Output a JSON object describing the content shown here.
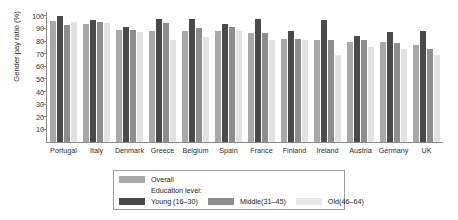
{
  "chart_data": {
    "type": "bar",
    "title": "",
    "xlabel": "",
    "ylabel": "Gender pay ratio (%)",
    "ylim": [
      0,
      103
    ],
    "yticks": [
      10,
      20,
      30,
      40,
      50,
      60,
      70,
      80,
      90,
      100
    ],
    "grid": false,
    "legend_position": "bottom-center",
    "categories": [
      "Portugal",
      "Italy",
      "Denmark",
      "Greece",
      "Belgium",
      "Spain",
      "France",
      "Finland",
      "Ireland",
      "Austria",
      "Germany",
      "UK"
    ],
    "series": [
      {
        "name": "Overall",
        "color": "#a8a8a8",
        "values": [
          96,
          93.5,
          89,
          88,
          88,
          88,
          86.5,
          82,
          81,
          79.5,
          79,
          77
        ]
      },
      {
        "name": "Young (16–30)",
        "color": "#4a4a4a",
        "values": [
          99.5,
          97,
          91.5,
          97.5,
          97.5,
          93.5,
          97.5,
          88,
          96.5,
          84,
          87,
          88
        ]
      },
      {
        "name": "Middle(31–45)",
        "color": "#8d8d8d",
        "values": [
          93,
          95,
          88.5,
          94,
          90.5,
          91.5,
          86,
          81.5,
          80.5,
          81,
          78.5,
          73.5
        ]
      },
      {
        "name": "Old(46–64)",
        "color": "#e2e2e2",
        "values": [
          95,
          94.5,
          87,
          81,
          83.5,
          88,
          81,
          80.5,
          69,
          75.5,
          74,
          69
        ]
      }
    ]
  },
  "legend": {
    "overall_label": "Overall",
    "education_level_title": "Education level:",
    "young_label": "Young (16–30)",
    "middle_label": "Middle(31–45)",
    "old_label": "Old(46–64)"
  }
}
